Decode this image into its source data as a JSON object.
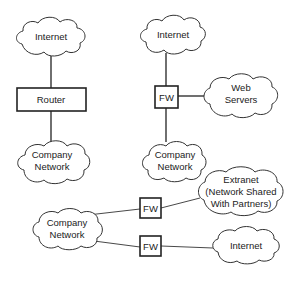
{
  "diagram": {
    "type": "network-topology",
    "panels": [
      {
        "id": "router-setup",
        "nodes": [
          {
            "id": "internet",
            "shape": "cloud",
            "label": "Internet"
          },
          {
            "id": "router",
            "shape": "box",
            "label": "Router"
          },
          {
            "id": "company",
            "shape": "cloud",
            "lines": [
              "Company",
              "Network"
            ]
          }
        ],
        "edges": [
          [
            "internet",
            "router"
          ],
          [
            "router",
            "company"
          ]
        ]
      },
      {
        "id": "firewall-dmz-setup",
        "nodes": [
          {
            "id": "internet",
            "shape": "cloud",
            "label": "Internet"
          },
          {
            "id": "fw",
            "shape": "box",
            "label": "FW"
          },
          {
            "id": "web",
            "shape": "cloud",
            "lines": [
              "Web",
              "Servers"
            ]
          },
          {
            "id": "company",
            "shape": "cloud",
            "lines": [
              "Company",
              "Network"
            ]
          }
        ],
        "edges": [
          [
            "internet",
            "fw"
          ],
          [
            "fw",
            "web"
          ],
          [
            "fw",
            "company"
          ]
        ]
      },
      {
        "id": "extranet-setup",
        "nodes": [
          {
            "id": "company",
            "shape": "cloud",
            "lines": [
              "Company",
              "Network"
            ]
          },
          {
            "id": "fw1",
            "shape": "box",
            "label": "FW"
          },
          {
            "id": "fw2",
            "shape": "box",
            "label": "FW"
          },
          {
            "id": "extranet",
            "shape": "cloud",
            "lines": [
              "Extranet",
              "(Network Shared",
              "With Partners)"
            ]
          },
          {
            "id": "internet",
            "shape": "cloud",
            "label": "Internet"
          }
        ],
        "edges": [
          [
            "company",
            "fw1"
          ],
          [
            "fw1",
            "extranet"
          ],
          [
            "company",
            "fw2"
          ],
          [
            "fw2",
            "internet"
          ]
        ]
      }
    ]
  }
}
